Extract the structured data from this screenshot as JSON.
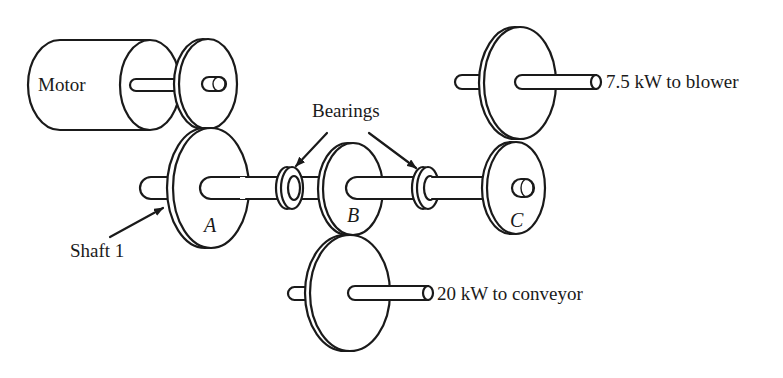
{
  "figure": {
    "components": {
      "motor": "Motor",
      "gear_a": "A",
      "gear_b": "B",
      "gear_c": "C",
      "shaft": "Shaft 1",
      "bearings": "Bearings"
    },
    "outputs": {
      "blower": "7.5 kW to blower",
      "conveyor": "20 kW to conveyor"
    },
    "colors": {
      "line": "#1a1a1a",
      "background": "#ffffff"
    }
  }
}
